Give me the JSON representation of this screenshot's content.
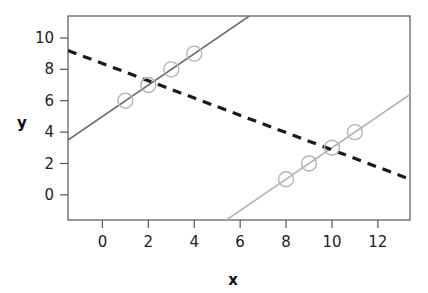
{
  "chart_data": {
    "type": "scatter",
    "title": "",
    "xlabel": "x",
    "ylabel": "y",
    "xlim": [
      -1.5,
      13.4
    ],
    "ylim": [
      -1.6,
      11.4
    ],
    "xticks": [
      0,
      2,
      4,
      6,
      8,
      10,
      12
    ],
    "yticks": [
      0,
      2,
      4,
      6,
      8,
      10
    ],
    "xtick_labels": [
      "0",
      "2",
      "4",
      "6",
      "8",
      "10",
      "12"
    ],
    "ytick_labels": [
      "0",
      "2",
      "4",
      "6",
      "8",
      "10"
    ],
    "grid": false,
    "legend": "none",
    "frame": true,
    "series": [
      {
        "name": "cluster-a-points",
        "type": "scatter",
        "marker": "open-circle",
        "color": "#b4b4b4",
        "x": [
          1,
          2,
          3,
          4
        ],
        "y": [
          6,
          7,
          8,
          9
        ]
      },
      {
        "name": "cluster-b-points",
        "type": "scatter",
        "marker": "open-circle",
        "color": "#b4b4b4",
        "x": [
          8,
          9,
          10,
          11
        ],
        "y": [
          1,
          2,
          3,
          4
        ]
      },
      {
        "name": "dark-fit-line",
        "type": "line",
        "style": "solid",
        "color": "#6e6e6e",
        "slope": 1,
        "intercept": 5,
        "x_start": -1.5,
        "y_start": 3.5,
        "x_end": 6.4,
        "y_end": 11.4
      },
      {
        "name": "light-fit-line",
        "type": "line",
        "style": "solid",
        "color": "#b4b4b4",
        "slope": 1,
        "intercept": -7,
        "x_start": 5.4,
        "y_start": -1.6,
        "x_end": 13.4,
        "y_end": 6.4
      },
      {
        "name": "dashed-trend-line",
        "type": "line",
        "style": "dashed",
        "color": "#1a1a1a",
        "slope": -0.55,
        "intercept": 8.4,
        "x_start": -1.5,
        "y_start": 9.2,
        "x_end": 13.4,
        "y_end": 1.0
      }
    ]
  },
  "axes": {
    "x_title": "x",
    "y_title": "y"
  },
  "colors": {
    "frame": "#555555",
    "tick": "#555555",
    "dark_line": "#6e6e6e",
    "light_line": "#b4b4b4",
    "dashed_line": "#1a1a1a",
    "marker": "#b4b4b4",
    "text": "#222222",
    "background": "#ffffff"
  }
}
